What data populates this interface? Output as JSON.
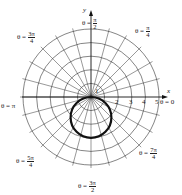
{
  "chart_data": {
    "type": "polar",
    "title": "",
    "grid": {
      "rings": [
        1,
        2,
        3,
        4,
        5
      ],
      "radial_step": "π/12",
      "ring_spacing_px": 13.6
    },
    "curve": {
      "equation": "r = -3 sin θ",
      "shape": "circle",
      "center_cartesian": [
        0,
        -1.5
      ],
      "radius": 1.5,
      "stroke": "#111111",
      "stroke_width": 2.2
    },
    "axes": {
      "x_label": "x",
      "y_label": "y",
      "x_ticks": [
        "1",
        "2",
        "3",
        "4",
        "5"
      ],
      "y_tick": "1"
    },
    "angle_labels": [
      {
        "id": "theta_0",
        "prefix": "θ = ",
        "num": "0",
        "den": ""
      },
      {
        "id": "theta_pi_4",
        "prefix": "θ = ",
        "num": "π",
        "den": "4"
      },
      {
        "id": "theta_pi_2",
        "prefix": "θ = ",
        "num": "π",
        "den": "2"
      },
      {
        "id": "theta_3pi_4",
        "prefix": "θ = ",
        "num": "3π",
        "den": "4"
      },
      {
        "id": "theta_pi",
        "prefix": "θ = ",
        "num": "π",
        "den": ""
      },
      {
        "id": "theta_5pi_4",
        "prefix": "θ = ",
        "num": "5π",
        "den": "4"
      },
      {
        "id": "theta_3pi_2",
        "prefix": "θ = ",
        "num": "3π",
        "den": "2"
      },
      {
        "id": "theta_7pi_4",
        "prefix": "θ = ",
        "num": "7π",
        "den": "4"
      }
    ]
  },
  "labels": {
    "x_axis": "x",
    "y_axis": "y",
    "tick_1": "1",
    "tick_2": "2",
    "tick_3": "3",
    "tick_4": "4",
    "tick_5": "5",
    "y_tick_1": "1",
    "theta_0": "θ = 0",
    "theta_pi": "θ = π",
    "theta_prefix": "θ = ",
    "pi_4_num": "π",
    "pi_4_den": "4",
    "pi_2_num": "π",
    "pi_2_den": "2",
    "three_pi_4_num": "3π",
    "three_pi_4_den": "4",
    "five_pi_4_num": "5π",
    "five_pi_4_den": "4",
    "three_pi_2_num": "3π",
    "three_pi_2_den": "2",
    "seven_pi_4_num": "7π",
    "seven_pi_4_den": "4"
  },
  "colors": {
    "grid": "#333333",
    "curve": "#111111",
    "text": "#222222",
    "background": "#ffffff"
  }
}
